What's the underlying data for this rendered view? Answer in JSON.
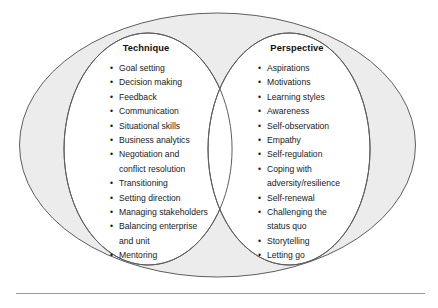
{
  "figure": {
    "name": "technique-perspective-venn",
    "outer_ellipse_label": "leadership-domain",
    "colors": {
      "outer_fill": "#ececec",
      "inner_fill": "#ffffff",
      "stroke": "#5e5e5e",
      "text": "#1a1a1a",
      "rule": "#9a9a9a"
    }
  },
  "circles": [
    {
      "id": "technique",
      "heading": "Technique",
      "items": [
        "Goal setting",
        "Decision making",
        "Feedback",
        "Communication",
        "Situational skills",
        "Business analytics",
        "Negotiation and\nconflict resolution",
        "Transitioning",
        "Setting direction",
        "Managing stakeholders",
        "Balancing enterprise\nand unit",
        "Mentoring"
      ]
    },
    {
      "id": "perspective",
      "heading": "Perspective",
      "items": [
        "Aspirations",
        "Motivations",
        "Learning styles",
        "Awareness",
        "Self-observation",
        "Empathy",
        "Self-regulation",
        "Coping with\nadversity/resilience",
        "Self-renewal",
        "Challenging the\nstatus quo",
        "Storytelling",
        "Letting go"
      ]
    }
  ]
}
